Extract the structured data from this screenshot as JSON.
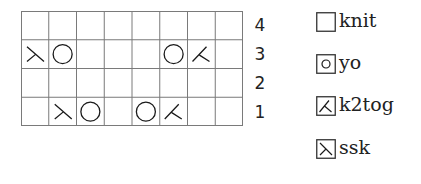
{
  "chart": {
    "columns": 8,
    "rows": [
      {
        "number": "4",
        "cells": [
          "knit",
          "knit",
          "knit",
          "knit",
          "knit",
          "knit",
          "knit",
          "knit"
        ]
      },
      {
        "number": "3",
        "cells": [
          "ssk",
          "yo",
          "knit",
          "knit",
          "knit",
          "yo",
          "k2tog",
          "knit"
        ]
      },
      {
        "number": "2",
        "cells": [
          "knit",
          "knit",
          "knit",
          "knit",
          "knit",
          "knit",
          "knit",
          "knit"
        ]
      },
      {
        "number": "1",
        "cells": [
          "knit",
          "ssk",
          "yo",
          "knit",
          "yo",
          "k2tog",
          "knit",
          "knit"
        ]
      }
    ]
  },
  "legend": {
    "items": [
      {
        "symbol": "knit",
        "label": "knit"
      },
      {
        "symbol": "yo",
        "label": "yo"
      },
      {
        "symbol": "k2tog",
        "label": "k2tog"
      },
      {
        "symbol": "ssk",
        "label": "ssk"
      }
    ]
  },
  "colors": {
    "grid_line": "#7a7a7a",
    "symbol": "#1a1a1a",
    "background": "#ffffff"
  }
}
